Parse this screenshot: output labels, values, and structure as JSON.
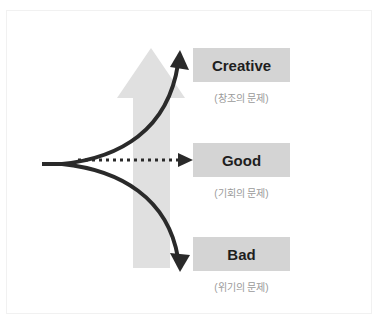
{
  "colors": {
    "big_arrow": "#e0e0e0",
    "curve": "#2a2a2a",
    "box_fill": "#d4d4d4",
    "box_text": "#1e1e1e",
    "subtitle_text": "#9a9a9a"
  },
  "outcomes": [
    {
      "label": "Creative",
      "subtitle": "(창조의 문제)",
      "path_style": "curve-up"
    },
    {
      "label": "Good",
      "subtitle": "(기회의 문제)",
      "path_style": "dotted-straight"
    },
    {
      "label": "Bad",
      "subtitle": "(위기의 문제)",
      "path_style": "curve-down"
    }
  ]
}
